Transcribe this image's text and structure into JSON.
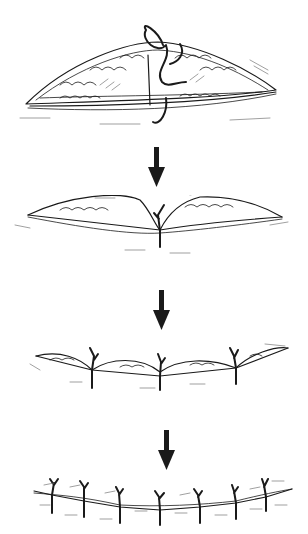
{
  "figure": {
    "title": "Interrupted suture wound closure sequence",
    "steps": [
      {
        "label": "Step 1: Needle and suture passed through both wound edges of open elliptical wound"
      },
      {
        "label": "Step 2: First central suture tied, approximating wound at midpoint"
      },
      {
        "label": "Step 3: Additional sutures placed bisecting remaining gaps (3 sutures)"
      },
      {
        "label": "Step 4: Wound fully closed with 7 interrupted sutures"
      }
    ],
    "arrows": 3,
    "ink_color": "#1a1a1a",
    "background": "#ffffff"
  }
}
